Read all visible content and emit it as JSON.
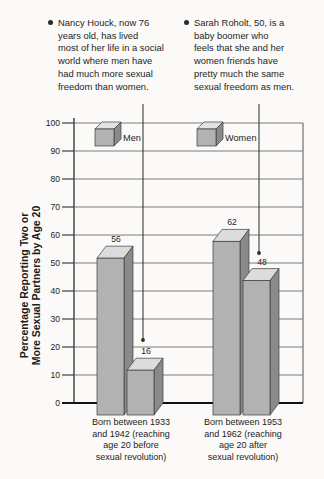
{
  "annotations": [
    {
      "text": "Nancy Houck, now 76\nyears old, has lived\nmost of her life in a social\nworld where men have\nhad much more sexual\nfreedom than women."
    },
    {
      "text": "Sarah Roholt, 50, is a\nbaby boomer who\nfeels that she and her\nwomen friends have\npretty much the same\nsexual freedom as men."
    }
  ],
  "chart_data": {
    "type": "bar",
    "title": "",
    "ylabel": "Percentage Reporting Two or\nMore Sexual Partners by Age 20",
    "xlabel": "",
    "ylim": [
      0,
      100
    ],
    "yticks": [
      0,
      10,
      20,
      30,
      40,
      50,
      60,
      70,
      80,
      90,
      100
    ],
    "categories": [
      "Born between 1933\nand 1942 (reaching\nage 20 before\nsexual revolution)",
      "Born between 1953\nand 1962 (reaching\nage 20 after\nsexual revolution)"
    ],
    "series": [
      {
        "name": "Men",
        "values": [
          56,
          62
        ]
      },
      {
        "name": "Women",
        "values": [
          16,
          48
        ]
      }
    ],
    "grid": true,
    "legend_position": "top-inside",
    "bar_style": "3d",
    "colors": {
      "bar_front": "#b2b2b2",
      "bar_side": "#8a8a8a",
      "bar_top": "#dcdcdc",
      "outline": "#3c3c3c",
      "gridline": "#6e6e6e",
      "axis": "#1c1c1c"
    }
  }
}
